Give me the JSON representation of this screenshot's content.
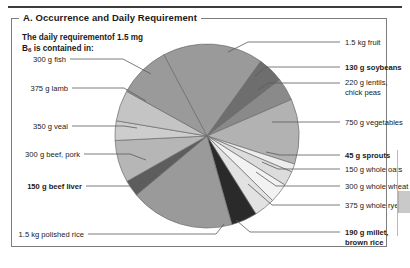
{
  "panel": {
    "title": "A. Occurrence and Daily Requirement",
    "subtitle_line1": "The daily requirementof 1.5 mg",
    "subtitle_line2_pre": "B",
    "subtitle_line2_sub": "6",
    "subtitle_line2_post": " is contained in:"
  },
  "labels": {
    "left": [
      {
        "text": "300 g fish",
        "bold": false
      },
      {
        "text": "375 g lamb",
        "bold": false
      },
      {
        "text": "350 g veal",
        "bold": false
      },
      {
        "text": "300 g beef, pork",
        "bold": false
      },
      {
        "text": "150 g beef liver",
        "bold": true
      },
      {
        "text": "1.5 kg polished rice",
        "bold": false
      }
    ],
    "right": [
      {
        "text": "1.5 kg fruit",
        "bold": false
      },
      {
        "text": "130 g soybeans",
        "bold": true
      },
      {
        "text": "220 g lentils,",
        "bold": false
      },
      {
        "text": "chick peas",
        "bold": false
      },
      {
        "text": "750 g vegetables",
        "bold": false
      },
      {
        "text": "45 g sprouts",
        "bold": true
      },
      {
        "text": "150 g whole oats",
        "bold": false
      },
      {
        "text": "300 g whole wheat",
        "bold": false
      },
      {
        "text": "375 g whole rye",
        "bold": false
      },
      {
        "text": "190 g millet,",
        "bold": true
      },
      {
        "text": "brown rice",
        "bold": true
      }
    ]
  },
  "chart_data": {
    "type": "pie",
    "title": "A. Occurrence and Daily Requirement",
    "subtitle": "The daily requirement of 1.5 mg B6 is contained in:",
    "legend_position": "leader-labels-around-pie",
    "center_px": [
      207,
      136
    ],
    "radius_px": 92,
    "start_angle_deg": -118,
    "categories": [
      "1.5 kg fruit",
      "130 g soybeans",
      "220 g lentils, chick peas",
      "750 g vegetables",
      "45 g sprouts",
      "150 g whole oats",
      "300 g whole wheat",
      "375 g whole rye",
      "190 g millet, brown rice",
      "1.5 kg polished rice",
      "150 g beef liver",
      "300 g beef, pork",
      "350 g veal",
      "375 g lamb",
      "300 g fish"
    ],
    "values": [
      62,
      16,
      14,
      40,
      5,
      9,
      12,
      13,
      16,
      64,
      10,
      26,
      12,
      19,
      32
    ],
    "colors": [
      "#9a9a9a",
      "#6e6e6e",
      "#8a8a8a",
      "#b2b2b2",
      "#ededed",
      "#dcdcdc",
      "#f2f2f2",
      "#e2e2e2",
      "#2a2a2a",
      "#9a9a9a",
      "#5d5d5d",
      "#b6b6b6",
      "#cdcdcd",
      "#c4c4c4",
      "#9a9a9a"
    ],
    "slice_edge_color": "#6b6b6b",
    "units": "angular share of 360 deg (proportional, unlabeled)"
  }
}
